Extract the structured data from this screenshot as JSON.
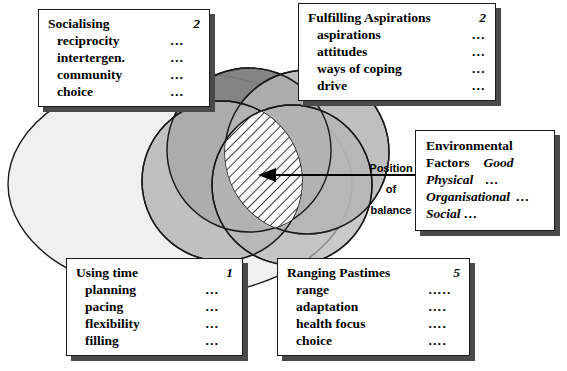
{
  "diagram": {
    "title_hidden": "Venn diagram of balance domains",
    "colors": {
      "background": "#ffffff",
      "outline": "#1a1a1a",
      "blob_fill": "#f0f0f0",
      "circle_light": "#c9c9c9",
      "circle_mid": "#ababab",
      "circle_dark": "#5a5a5a",
      "circle_darker": "#737373",
      "hatch_fill": "#ffffff",
      "box_shadow": "#4a4a4a",
      "box_fill": "#ffffff",
      "arrow": "#000000"
    },
    "pointer": {
      "label_lines": [
        "Position",
        "of",
        "balance"
      ],
      "target": "hatched-intersection"
    }
  },
  "boxes": {
    "socialising": {
      "title": "Socialising",
      "number": "2",
      "items": [
        {
          "label": "reciprocity",
          "dots": "…"
        },
        {
          "label": "intertergen.",
          "dots": "…"
        },
        {
          "label": "community",
          "dots": "…"
        },
        {
          "label": "choice",
          "dots": "…"
        }
      ]
    },
    "aspirations": {
      "title": "Fulfilling Aspirations",
      "number": "2",
      "items": [
        {
          "label": "aspirations",
          "dots": "…"
        },
        {
          "label": "attitudes",
          "dots": "…"
        },
        {
          "label": "ways of coping",
          "dots": "…"
        },
        {
          "label": "drive",
          "dots": "…"
        }
      ]
    },
    "environmental": {
      "title_line1": "Environmental",
      "title_line2": "Factors",
      "rating": "Good",
      "items": [
        {
          "label": "Physical",
          "dots": "…"
        },
        {
          "label": "Organisational",
          "dots": "…"
        },
        {
          "label": "Social …",
          "dots": ""
        }
      ]
    },
    "using_time": {
      "title": "Using time",
      "number": "1",
      "items": [
        {
          "label": "planning",
          "dots": "…"
        },
        {
          "label": "pacing",
          "dots": "…"
        },
        {
          "label": "flexibility",
          "dots": "…"
        },
        {
          "label": "filling",
          "dots": "…"
        }
      ]
    },
    "ranging_pastimes": {
      "title": "Ranging Pastimes",
      "number": "5",
      "items": [
        {
          "label": "range",
          "dots": "….."
        },
        {
          "label": "adaptation",
          "dots": "…."
        },
        {
          "label": "health focus",
          "dots": "…."
        },
        {
          "label": "choice",
          "dots": "…."
        }
      ]
    }
  }
}
